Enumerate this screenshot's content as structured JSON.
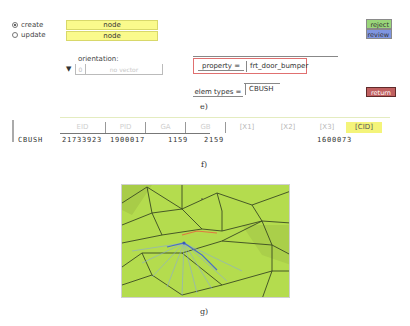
{
  "mode": {
    "options": [
      {
        "label": "create",
        "selected": true
      },
      {
        "label": "update",
        "selected": false
      }
    ],
    "fields": [
      "node",
      "node"
    ]
  },
  "buttons": {
    "reject": "reject",
    "review": "review",
    "return": "return"
  },
  "orientation": {
    "label": "orientation:",
    "dropdown_icon": "▼",
    "index": "0",
    "vector_placeholder": "no vector"
  },
  "property": {
    "label": "property =",
    "value": "frt_door_bumper"
  },
  "elem_types": {
    "label": "elem types =",
    "value": "CBUSH"
  },
  "captions": {
    "e": "e)",
    "f": "f)",
    "g": "g)"
  },
  "table": {
    "columns": [
      "EID",
      "PID",
      "GA",
      "GB",
      "[X1]",
      "[X2]",
      "[X3]",
      "[CID]"
    ],
    "rows": [
      {
        "type": "CBUSH",
        "eid": "21733923",
        "pid": "1900017",
        "ga": "1159",
        "gb": "2159",
        "x1": "",
        "x2": "",
        "x3": "",
        "cid": "1600073"
      }
    ]
  },
  "colors": {
    "yellow_field": "#fafa8c",
    "reject": "#9ad67a",
    "review": "#7f95e0",
    "return": "#c06060",
    "mesh_green": "#b4dc4e",
    "highlight_border": "#e07070"
  }
}
